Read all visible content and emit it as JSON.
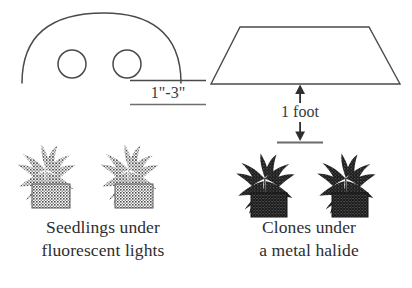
{
  "figure": {
    "title_alt": "Seedling and clone lighting distance diagram",
    "background_color": "#ffffff",
    "ink_color": "#3a3a3a",
    "plant_color_left": "#5a5a5a",
    "plant_color_right": "#1c1c1c"
  },
  "left_panel": {
    "fixture": {
      "shape": "dome",
      "name": "fluorescent-fixture-dome",
      "bulb_count": 2
    },
    "measurement": {
      "value": "1\"-3\"",
      "name": "distance-one-to-three-inches"
    },
    "plants": [
      {
        "name": "seedling-plant-1"
      },
      {
        "name": "seedling-plant-2"
      }
    ],
    "caption": {
      "line1": "Seedlings under",
      "line2": "fluorescent lights"
    }
  },
  "right_panel": {
    "fixture": {
      "shape": "trapezoid",
      "name": "metal-halide-fixture-reflector"
    },
    "measurement": {
      "value": "1 foot",
      "name": "distance-one-foot"
    },
    "plants": [
      {
        "name": "clone-plant-1"
      },
      {
        "name": "clone-plant-2"
      }
    ],
    "caption": {
      "line1": "Clones under",
      "line2": "a metal halide"
    }
  }
}
